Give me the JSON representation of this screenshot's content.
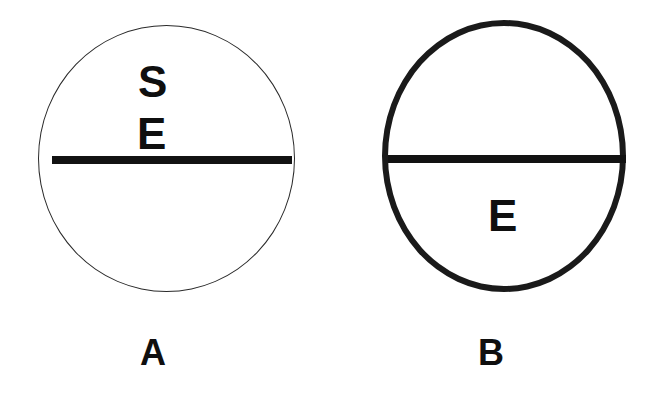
{
  "figure": {
    "background_color": "#ffffff",
    "ink_color": "#0f0f0f",
    "width": 662,
    "height": 405,
    "panels": [
      {
        "id": "A",
        "caption": "A",
        "circle": {
          "outline_style": "thin",
          "outline_width_px": 1.6,
          "outline_color": "#2a2a2a",
          "fill": "none",
          "center_x": 166,
          "center_y": 158,
          "width_px": 257,
          "height_px": 267
        },
        "diameter_line": {
          "orientation": "horizontal",
          "color": "#121212",
          "thickness_px": 8,
          "y": 160,
          "x_start": 52,
          "x_end": 292
        },
        "region_labels": [
          {
            "text": "S",
            "position": "upper-half",
            "x": 138,
            "y": 60
          },
          {
            "text": "E",
            "position": "upper-half",
            "x": 137,
            "y": 112
          }
        ]
      },
      {
        "id": "B",
        "caption": "B",
        "circle": {
          "outline_style": "thick",
          "outline_width_px": 6.5,
          "outline_color": "#1a1a1a",
          "fill": "none",
          "center_x": 504,
          "center_y": 156,
          "width_px": 244,
          "height_px": 272
        },
        "diameter_line": {
          "orientation": "horizontal",
          "color": "#121212",
          "thickness_px": 8,
          "y": 159,
          "x_start": 388,
          "x_end": 626
        },
        "region_labels": [
          {
            "text": "E",
            "position": "lower-half",
            "x": 488,
            "y": 194
          }
        ]
      }
    ]
  }
}
